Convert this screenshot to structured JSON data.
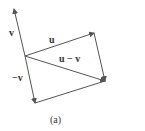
{
  "diagram": {
    "caption": "(a)",
    "labels": {
      "v": "v",
      "u": "u",
      "u_minus_v": "u − v",
      "neg_v": "−v"
    },
    "stroke_color": "#555555",
    "points": {
      "origin": [
        25,
        56
      ],
      "v_tip": [
        14,
        9
      ],
      "u_tip": [
        94,
        33
      ],
      "neg_v_tip": [
        35,
        103
      ],
      "u_minus_v_tip": [
        105,
        81
      ]
    }
  }
}
